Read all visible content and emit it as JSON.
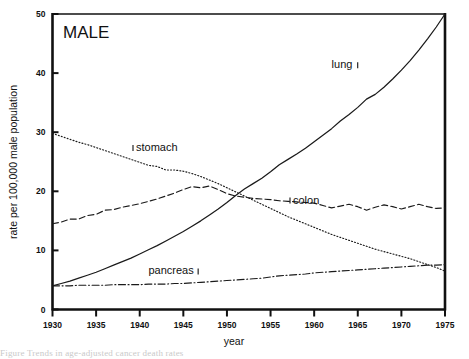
{
  "figure": {
    "panel_title": "MALE",
    "cropped_caption": "Figure  Trends in age-adjusted cancer death rates"
  },
  "chart_data": {
    "type": "line",
    "title": "MALE",
    "xlabel": "year",
    "ylabel": "rate per 100,000 male population",
    "xlim": [
      1930,
      1975
    ],
    "ylim": [
      0,
      50
    ],
    "xticks": [
      1930,
      1935,
      1940,
      1945,
      1950,
      1955,
      1960,
      1965,
      1970,
      1975
    ],
    "yticks": [
      0,
      10,
      20,
      30,
      40,
      50
    ],
    "grid": false,
    "legend": "inline-labels",
    "x": [
      1930,
      1931,
      1932,
      1933,
      1934,
      1935,
      1936,
      1937,
      1938,
      1939,
      1940,
      1941,
      1942,
      1943,
      1944,
      1945,
      1946,
      1947,
      1948,
      1949,
      1950,
      1951,
      1952,
      1953,
      1954,
      1955,
      1956,
      1957,
      1958,
      1959,
      1960,
      1961,
      1962,
      1963,
      1964,
      1965,
      1966,
      1967,
      1968,
      1969,
      1970,
      1971,
      1972,
      1973,
      1974,
      1975
    ],
    "series": [
      {
        "name": "lung",
        "label": "lung",
        "style": "solid",
        "label_x": 1962,
        "label_y": 41.5,
        "values": [
          4.0,
          4.4,
          4.8,
          5.3,
          5.8,
          6.3,
          6.9,
          7.5,
          8.1,
          8.7,
          9.4,
          10.1,
          10.8,
          11.6,
          12.4,
          13.2,
          14.1,
          15.0,
          16.0,
          17.0,
          18.1,
          19.3,
          20.4,
          21.3,
          22.2,
          23.3,
          24.5,
          25.4,
          26.3,
          27.3,
          28.4,
          29.5,
          30.6,
          31.9,
          33.0,
          34.2,
          35.6,
          36.4,
          37.6,
          39.0,
          40.5,
          42.1,
          43.9,
          45.8,
          47.8,
          50.0
        ]
      },
      {
        "name": "stomach",
        "label": "stomach",
        "style": "dotted",
        "label_x": 1939,
        "label_y": 27.5,
        "values": [
          29.8,
          29.3,
          28.8,
          28.3,
          27.9,
          27.4,
          26.9,
          26.4,
          25.9,
          25.4,
          24.9,
          24.4,
          24.2,
          23.6,
          23.6,
          23.4,
          23.0,
          22.5,
          21.9,
          21.3,
          20.6,
          19.9,
          19.2,
          18.5,
          17.8,
          17.1,
          16.4,
          15.7,
          15.1,
          14.5,
          13.9,
          13.3,
          12.7,
          12.2,
          11.7,
          11.2,
          10.7,
          10.2,
          9.8,
          9.4,
          9.0,
          8.6,
          8.1,
          7.6,
          7.1,
          6.5
        ]
      },
      {
        "name": "colon",
        "label": "colon",
        "style": "dashed",
        "label_x": 1957,
        "label_y": 18.6,
        "values": [
          14.5,
          14.8,
          15.3,
          15.3,
          15.9,
          16.1,
          16.8,
          16.9,
          17.3,
          17.6,
          17.9,
          18.3,
          18.7,
          19.2,
          19.7,
          20.3,
          20.8,
          20.6,
          20.9,
          20.3,
          19.6,
          19.2,
          19.0,
          18.8,
          18.7,
          18.6,
          18.4,
          18.3,
          18.2,
          18.1,
          18.0,
          17.6,
          17.2,
          17.5,
          17.8,
          17.4,
          16.8,
          17.3,
          17.7,
          17.4,
          17.0,
          17.4,
          17.8,
          17.4,
          17.1,
          17.2
        ]
      },
      {
        "name": "pancreas",
        "label": "pancreas",
        "style": "dashdot",
        "label_x": 1941,
        "label_y": 6.6,
        "values": [
          4.0,
          4.0,
          4.0,
          4.1,
          4.1,
          4.1,
          4.1,
          4.2,
          4.2,
          4.2,
          4.2,
          4.3,
          4.3,
          4.3,
          4.4,
          4.4,
          4.5,
          4.6,
          4.7,
          4.8,
          4.9,
          5.0,
          5.1,
          5.2,
          5.3,
          5.5,
          5.7,
          5.8,
          5.9,
          6.0,
          6.2,
          6.3,
          6.4,
          6.5,
          6.6,
          6.7,
          6.8,
          6.9,
          7.0,
          7.1,
          7.2,
          7.3,
          7.4,
          7.5,
          7.5,
          7.6
        ]
      }
    ]
  }
}
